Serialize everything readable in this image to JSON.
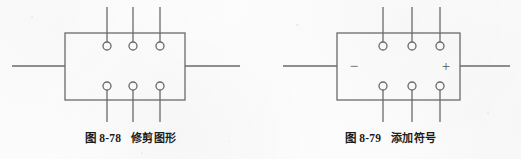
{
  "page": {
    "background_color": "#fdfdfd",
    "ink_color": "#5a5a5a",
    "text_color": "#1c1c1c",
    "width": 521,
    "height": 159
  },
  "figures": [
    {
      "id": "figure-trim",
      "caption_number": "图 8-78",
      "caption_text": "修剪图形",
      "box": {
        "x": 65,
        "y": 33,
        "width": 120,
        "height": 67
      },
      "left_lead": {
        "x1": 12,
        "x2": 65,
        "y": 66
      },
      "right_lead": {
        "x1": 185,
        "x2": 240,
        "y": 66
      },
      "top_pins": [
        {
          "x": 107,
          "line_top": 7,
          "circle_cy": 46,
          "circle_r": 4
        },
        {
          "x": 133,
          "line_top": 7,
          "circle_cy": 46,
          "circle_r": 4
        },
        {
          "x": 160,
          "line_top": 7,
          "circle_cy": 46,
          "circle_r": 4
        }
      ],
      "bottom_pins": [
        {
          "x": 107,
          "line_bottom": 122,
          "circle_cy": 86,
          "circle_r": 4
        },
        {
          "x": 133,
          "line_bottom": 122,
          "circle_cy": 86,
          "circle_r": 4
        },
        {
          "x": 160,
          "line_bottom": 122,
          "circle_cy": 86,
          "circle_r": 4
        }
      ],
      "symbols": []
    },
    {
      "id": "figure-symbols",
      "caption_number": "图 8-79",
      "caption_text": "添加符号",
      "box": {
        "x": 77,
        "y": 33,
        "width": 123,
        "height": 67
      },
      "left_lead": {
        "x1": 23,
        "x2": 77,
        "y": 66
      },
      "right_lead": {
        "x1": 200,
        "x2": 250,
        "y": 66
      },
      "top_pins": [
        {
          "x": 123,
          "line_top": 7,
          "circle_cy": 46,
          "circle_r": 4
        },
        {
          "x": 152,
          "line_top": 7,
          "circle_cy": 46,
          "circle_r": 4
        },
        {
          "x": 180,
          "line_top": 7,
          "circle_cy": 46,
          "circle_r": 4
        }
      ],
      "bottom_pins": [
        {
          "x": 123,
          "line_bottom": 122,
          "circle_cy": 86,
          "circle_r": 4
        },
        {
          "x": 152,
          "line_bottom": 122,
          "circle_cy": 86,
          "circle_r": 4
        },
        {
          "x": 180,
          "line_bottom": 122,
          "circle_cy": 86,
          "circle_r": 4
        }
      ],
      "symbols": [
        {
          "name": "minus-sign",
          "glyph": "−",
          "x": 94,
          "y": 68
        },
        {
          "name": "plus-sign",
          "glyph": "+",
          "x": 186,
          "y": 68
        }
      ]
    }
  ]
}
